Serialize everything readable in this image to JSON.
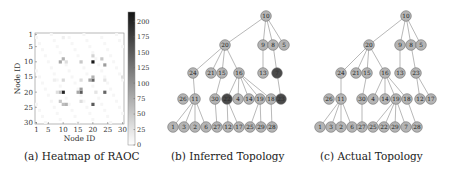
{
  "captions": {
    "a": "(a) Heatmap of RAOC",
    "b": "(b) Inferred Topology",
    "c": "(c) Actual Topology"
  },
  "chart_data": [
    {
      "type": "heatmap",
      "title": "Heatmap of RAOC",
      "xlabel": "Node ID",
      "ylabel": "Node ID",
      "x_ticks": [
        "1",
        "5",
        "10",
        "15",
        "20",
        "25",
        "30"
      ],
      "y_ticks": [
        "1",
        "5",
        "10",
        "15",
        "20",
        "25",
        "30"
      ],
      "grid_size": 30,
      "colorbar": {
        "min": 0,
        "max": 215,
        "ticks": [
          "0",
          "25",
          "50",
          "75",
          "100",
          "125",
          "150",
          "175",
          "200"
        ],
        "colormap": "greys"
      },
      "cells": [
        {
          "x": 20,
          "y": 10,
          "v": 210
        },
        {
          "x": 10,
          "y": 20,
          "v": 200
        },
        {
          "x": 20,
          "y": 24,
          "v": 150
        },
        {
          "x": 24,
          "y": 20,
          "v": 140
        },
        {
          "x": 16,
          "y": 20,
          "v": 150
        },
        {
          "x": 20,
          "y": 16,
          "v": 140
        },
        {
          "x": 9,
          "y": 10,
          "v": 80
        },
        {
          "x": 10,
          "y": 9,
          "v": 70
        },
        {
          "x": 24,
          "y": 11,
          "v": 90
        },
        {
          "x": 23,
          "y": 9,
          "v": 50
        },
        {
          "x": 16,
          "y": 10,
          "v": 50
        },
        {
          "x": 16,
          "y": 19,
          "v": 90
        },
        {
          "x": 19,
          "y": 16,
          "v": 80
        },
        {
          "x": 10,
          "y": 24,
          "v": 60
        },
        {
          "x": 11,
          "y": 24,
          "v": 70
        },
        {
          "x": 9,
          "y": 23,
          "v": 50
        },
        {
          "x": 20,
          "y": 8,
          "v": 40
        },
        {
          "x": 9,
          "y": 20,
          "v": 60
        },
        {
          "x": 10,
          "y": 16,
          "v": 35
        },
        {
          "x": 20,
          "y": 15,
          "v": 70
        },
        {
          "x": 15,
          "y": 20,
          "v": 80
        },
        {
          "x": 16,
          "y": 23,
          "v": 30
        },
        {
          "x": 11,
          "y": 10,
          "v": 30
        },
        {
          "x": 24,
          "y": 16,
          "v": 25
        },
        {
          "x": 30,
          "y": 15,
          "v": 30
        },
        {
          "x": 8,
          "y": 20,
          "v": 30
        },
        {
          "x": 21,
          "y": 20,
          "v": 25
        },
        {
          "x": 16,
          "y": 16,
          "v": 30
        },
        {
          "x": 10,
          "y": 2,
          "v": 15
        },
        {
          "x": 7,
          "y": 16,
          "v": 15
        }
      ]
    },
    {
      "type": "tree",
      "title": "Inferred Topology",
      "nodes": [
        {
          "id": "10",
          "x": 116,
          "y": 16,
          "dark": false
        },
        {
          "id": "20",
          "x": 75,
          "y": 45,
          "dark": false
        },
        {
          "id": "9",
          "x": 113,
          "y": 45,
          "dark": false
        },
        {
          "id": "8",
          "x": 123,
          "y": 45,
          "dark": false
        },
        {
          "id": "5",
          "x": 134,
          "y": 45,
          "dark": false
        },
        {
          "id": "24",
          "x": 43,
          "y": 73,
          "dark": false
        },
        {
          "id": "21",
          "x": 61,
          "y": 73,
          "dark": false
        },
        {
          "id": "15",
          "x": 72,
          "y": 73,
          "dark": false
        },
        {
          "id": "16",
          "x": 89,
          "y": 73,
          "dark": false
        },
        {
          "id": "13",
          "x": 113,
          "y": 73,
          "dark": false
        },
        {
          "id": "7",
          "x": 127,
          "y": 73,
          "dark": true
        },
        {
          "id": "26",
          "x": 33,
          "y": 99,
          "dark": false
        },
        {
          "id": "11",
          "x": 45,
          "y": 99,
          "dark": false
        },
        {
          "id": "30",
          "x": 65,
          "y": 99,
          "dark": false
        },
        {
          "id": "22",
          "x": 77,
          "y": 99,
          "dark": true
        },
        {
          "id": "4",
          "x": 88,
          "y": 99,
          "dark": false
        },
        {
          "id": "14",
          "x": 99,
          "y": 99,
          "dark": false
        },
        {
          "id": "19",
          "x": 110,
          "y": 99,
          "dark": false
        },
        {
          "id": "18",
          "x": 121,
          "y": 99,
          "dark": false
        },
        {
          "id": "23",
          "x": 131,
          "y": 99,
          "dark": true
        },
        {
          "id": "1",
          "x": 23,
          "y": 127,
          "dark": false
        },
        {
          "id": "3",
          "x": 34,
          "y": 127,
          "dark": false
        },
        {
          "id": "2",
          "x": 45,
          "y": 127,
          "dark": false
        },
        {
          "id": "6",
          "x": 56,
          "y": 127,
          "dark": false
        },
        {
          "id": "27",
          "x": 67,
          "y": 127,
          "dark": false
        },
        {
          "id": "12",
          "x": 78,
          "y": 127,
          "dark": false
        },
        {
          "id": "17",
          "x": 89,
          "y": 127,
          "dark": false
        },
        {
          "id": "25",
          "x": 100,
          "y": 127,
          "dark": false
        },
        {
          "id": "29",
          "x": 111,
          "y": 127,
          "dark": false
        },
        {
          "id": "28",
          "x": 122,
          "y": 127,
          "dark": false
        }
      ],
      "edges": [
        [
          "10",
          "20"
        ],
        [
          "10",
          "9"
        ],
        [
          "10",
          "8"
        ],
        [
          "10",
          "5"
        ],
        [
          "20",
          "24"
        ],
        [
          "20",
          "21"
        ],
        [
          "20",
          "15"
        ],
        [
          "20",
          "16"
        ],
        [
          "9",
          "13"
        ],
        [
          "8",
          "7"
        ],
        [
          "24",
          "11"
        ],
        [
          "15",
          "30"
        ],
        [
          "16",
          "22"
        ],
        [
          "16",
          "4"
        ],
        [
          "16",
          "14"
        ],
        [
          "16",
          "19"
        ],
        [
          "16",
          "18"
        ],
        [
          "7",
          "23"
        ],
        [
          "11",
          "1"
        ],
        [
          "11",
          "3"
        ],
        [
          "11",
          "2"
        ],
        [
          "11",
          "6"
        ],
        [
          "30",
          "27"
        ],
        [
          "22",
          "12"
        ],
        [
          "22",
          "17"
        ],
        [
          "19",
          "25"
        ],
        [
          "19",
          "29"
        ],
        [
          "18",
          "28"
        ]
      ]
    },
    {
      "type": "tree",
      "title": "Actual Topology",
      "nodes": [
        {
          "id": "10",
          "x": 106,
          "y": 16,
          "dark": false
        },
        {
          "id": "20",
          "x": 69,
          "y": 45,
          "dark": false
        },
        {
          "id": "9",
          "x": 100,
          "y": 45,
          "dark": false
        },
        {
          "id": "8",
          "x": 111,
          "y": 45,
          "dark": false
        },
        {
          "id": "5",
          "x": 121,
          "y": 45,
          "dark": false
        },
        {
          "id": "24",
          "x": 41,
          "y": 73,
          "dark": false
        },
        {
          "id": "21",
          "x": 56,
          "y": 73,
          "dark": false
        },
        {
          "id": "15",
          "x": 67,
          "y": 73,
          "dark": false
        },
        {
          "id": "16",
          "x": 85,
          "y": 73,
          "dark": false
        },
        {
          "id": "13",
          "x": 100,
          "y": 73,
          "dark": false
        },
        {
          "id": "23",
          "x": 116,
          "y": 73,
          "dark": false
        },
        {
          "id": "26",
          "x": 29,
          "y": 99,
          "dark": false
        },
        {
          "id": "11",
          "x": 41,
          "y": 99,
          "dark": false
        },
        {
          "id": "30",
          "x": 62,
          "y": 99,
          "dark": false
        },
        {
          "id": "4",
          "x": 73,
          "y": 99,
          "dark": false
        },
        {
          "id": "14",
          "x": 85,
          "y": 99,
          "dark": false
        },
        {
          "id": "19",
          "x": 96,
          "y": 99,
          "dark": false
        },
        {
          "id": "18",
          "x": 107,
          "y": 99,
          "dark": false
        },
        {
          "id": "12",
          "x": 120,
          "y": 99,
          "dark": false
        },
        {
          "id": "17",
          "x": 131,
          "y": 99,
          "dark": false
        },
        {
          "id": "1",
          "x": 20,
          "y": 127,
          "dark": false
        },
        {
          "id": "3",
          "x": 31,
          "y": 127,
          "dark": false
        },
        {
          "id": "2",
          "x": 41,
          "y": 127,
          "dark": false
        },
        {
          "id": "6",
          "x": 52,
          "y": 127,
          "dark": false
        },
        {
          "id": "27",
          "x": 62,
          "y": 127,
          "dark": false
        },
        {
          "id": "25",
          "x": 73,
          "y": 127,
          "dark": false
        },
        {
          "id": "22",
          "x": 84,
          "y": 127,
          "dark": false
        },
        {
          "id": "29",
          "x": 95,
          "y": 127,
          "dark": false
        },
        {
          "id": "7",
          "x": 106,
          "y": 127,
          "dark": false
        },
        {
          "id": "28",
          "x": 117,
          "y": 127,
          "dark": false
        }
      ],
      "edges": [
        [
          "10",
          "20"
        ],
        [
          "10",
          "9"
        ],
        [
          "10",
          "8"
        ],
        [
          "10",
          "5"
        ],
        [
          "20",
          "24"
        ],
        [
          "20",
          "21"
        ],
        [
          "20",
          "15"
        ],
        [
          "20",
          "16"
        ],
        [
          "9",
          "13"
        ],
        [
          "8",
          "23"
        ],
        [
          "24",
          "11"
        ],
        [
          "15",
          "30"
        ],
        [
          "16",
          "4"
        ],
        [
          "16",
          "14"
        ],
        [
          "16",
          "19"
        ],
        [
          "16",
          "18"
        ],
        [
          "23",
          "12"
        ],
        [
          "23",
          "17"
        ],
        [
          "11",
          "1"
        ],
        [
          "11",
          "3"
        ],
        [
          "11",
          "2"
        ],
        [
          "11",
          "6"
        ],
        [
          "30",
          "27"
        ],
        [
          "19",
          "25"
        ],
        [
          "19",
          "22"
        ],
        [
          "19",
          "29"
        ],
        [
          "19",
          "7"
        ],
        [
          "18",
          "28"
        ]
      ]
    }
  ],
  "colors": {
    "node_fill": "#b4b4b4",
    "node_dark_fill": "#4a4a4a",
    "node_stroke": "#6e6e6e",
    "edge": "#9a9a9a",
    "text": "#222222"
  }
}
